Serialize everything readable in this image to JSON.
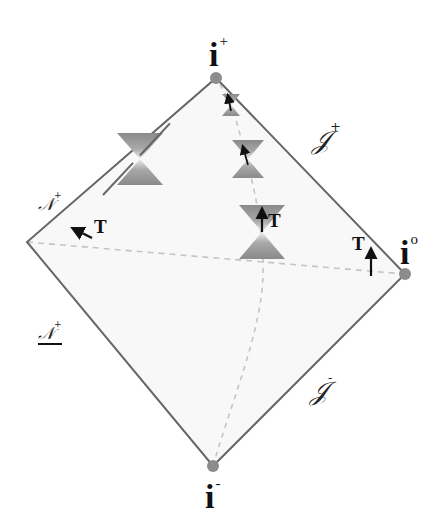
{
  "diagram": {
    "type": "penrose-diagram",
    "colors": {
      "background": "#ffffff",
      "region_fill": "#f8f8f8",
      "edge": "#666666",
      "vertex_dot": "#8c8c8c",
      "dashed": "#c4c4c4",
      "cone_dark": "#8a8a8a",
      "cone_light": "#e6e6e6",
      "text": "#111111"
    },
    "vertices": {
      "top": {
        "x": 216,
        "y": 78
      },
      "right": {
        "x": 405,
        "y": 274
      },
      "bottom": {
        "x": 213,
        "y": 466
      },
      "left": {
        "x": 27,
        "y": 242
      }
    },
    "labels": {
      "i_plus": {
        "base": "i",
        "sup": "+"
      },
      "i_zero": {
        "base": "i",
        "sup": "o"
      },
      "i_minus": {
        "base": "i",
        "sup": "-"
      },
      "scri_plus": {
        "base": "𝒥",
        "sup": "+"
      },
      "scri_minus": {
        "base": "𝒥",
        "sup": "-"
      },
      "n_upper": {
        "base": "𝒩",
        "sup": "+"
      },
      "n_lower": {
        "base": "𝒩",
        "sup": "+"
      },
      "t_left": "T",
      "t_center": "T",
      "t_right": "T"
    },
    "light_cones": [
      {
        "name": "cone-horizon",
        "cx": 140,
        "cy": 159,
        "half_width": 23,
        "half_height": 26
      },
      {
        "name": "cone-top-small",
        "cx": 231,
        "cy": 105,
        "half_width": 9,
        "half_height": 11
      },
      {
        "name": "cone-upper",
        "cx": 248,
        "cy": 159,
        "half_width": 16,
        "half_height": 19
      },
      {
        "name": "cone-middle",
        "cx": 262,
        "cy": 232,
        "half_width": 23,
        "half_height": 27
      }
    ],
    "time_vectors": [
      {
        "name": "t-arrow-horizon",
        "x1": 92,
        "y1": 238,
        "x2": 74,
        "y2": 229
      },
      {
        "name": "t-arrow-top",
        "x1": 231,
        "y1": 111,
        "x2": 228,
        "y2": 96
      },
      {
        "name": "t-arrow-upper",
        "x1": 248,
        "y1": 165,
        "x2": 243,
        "y2": 147
      },
      {
        "name": "t-arrow-middle",
        "x1": 262,
        "y1": 232,
        "x2": 262,
        "y2": 210
      },
      {
        "name": "t-arrow-infinity",
        "x1": 371,
        "y1": 276,
        "x2": 371,
        "y2": 250
      }
    ]
  }
}
